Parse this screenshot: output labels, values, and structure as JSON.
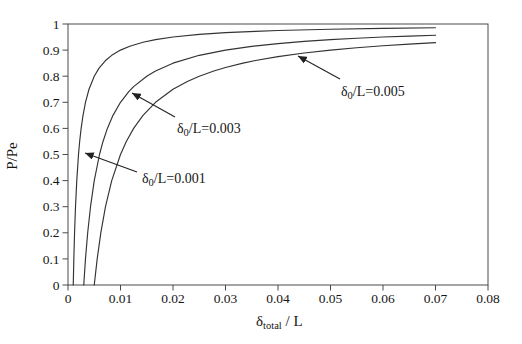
{
  "figure": {
    "background": "#ffffff"
  },
  "chart_data": {
    "type": "line",
    "title": "",
    "xlabel": {
      "symbol": "δ",
      "subscript": "total",
      "suffix": " / L"
    },
    "ylabel": "P/Pe",
    "xlim": [
      0,
      0.08
    ],
    "ylim": [
      0,
      1
    ],
    "grid": false,
    "frame": true,
    "legend_position": "none",
    "x_ticks": [
      {
        "v": 0,
        "label": "0"
      },
      {
        "v": 0.01,
        "label": "0.01"
      },
      {
        "v": 0.02,
        "label": "0.02"
      },
      {
        "v": 0.03,
        "label": "0.03"
      },
      {
        "v": 0.04,
        "label": "0.04"
      },
      {
        "v": 0.05,
        "label": "0.05"
      },
      {
        "v": 0.06,
        "label": "0.06"
      },
      {
        "v": 0.07,
        "label": "0.07"
      },
      {
        "v": 0.08,
        "label": "0.08"
      }
    ],
    "y_ticks": [
      {
        "v": 0,
        "label": "0"
      },
      {
        "v": 0.1,
        "label": "0.1"
      },
      {
        "v": 0.2,
        "label": "0.2"
      },
      {
        "v": 0.3,
        "label": "0.3"
      },
      {
        "v": 0.4,
        "label": "0.4"
      },
      {
        "v": 0.5,
        "label": "0.5"
      },
      {
        "v": 0.6,
        "label": "0.6"
      },
      {
        "v": 0.7,
        "label": "0.7"
      },
      {
        "v": 0.8,
        "label": "0.8"
      },
      {
        "v": 0.9,
        "label": "0.9"
      },
      {
        "v": 1,
        "label": "1"
      }
    ],
    "series": [
      {
        "id": "delta0-0001",
        "label_text": "δ0/L=0.001",
        "delta0_over_L": 0.001,
        "points": [
          [
            0.001,
            0
          ],
          [
            0.00111,
            0.1
          ],
          [
            0.00125,
            0.2
          ],
          [
            0.00143,
            0.3
          ],
          [
            0.00167,
            0.4
          ],
          [
            0.002,
            0.5
          ],
          [
            0.00222,
            0.55
          ],
          [
            0.0025,
            0.6
          ],
          [
            0.00286,
            0.65
          ],
          [
            0.00333,
            0.7
          ],
          [
            0.004,
            0.75
          ],
          [
            0.005,
            0.8
          ],
          [
            0.00588,
            0.83
          ],
          [
            0.00714,
            0.86
          ],
          [
            0.00833,
            0.88
          ],
          [
            0.01,
            0.9
          ],
          [
            0.01176,
            0.915
          ],
          [
            0.01429,
            0.93
          ],
          [
            0.01667,
            0.94
          ],
          [
            0.02,
            0.95
          ],
          [
            0.025,
            0.96
          ],
          [
            0.03,
            0.9667
          ],
          [
            0.03571,
            0.972
          ],
          [
            0.04,
            0.975
          ],
          [
            0.05,
            0.98
          ],
          [
            0.06,
            0.9833
          ],
          [
            0.07,
            0.9857
          ]
        ]
      },
      {
        "id": "delta0-0003",
        "label_text": "δ0/L=0.003",
        "delta0_over_L": 0.003,
        "points": [
          [
            0.003,
            0
          ],
          [
            0.00333,
            0.1
          ],
          [
            0.00375,
            0.2
          ],
          [
            0.00429,
            0.3
          ],
          [
            0.005,
            0.4
          ],
          [
            0.006,
            0.5
          ],
          [
            0.00667,
            0.55
          ],
          [
            0.0075,
            0.6
          ],
          [
            0.00857,
            0.65
          ],
          [
            0.01,
            0.7
          ],
          [
            0.01154,
            0.74
          ],
          [
            0.0125,
            0.76
          ],
          [
            0.015,
            0.8
          ],
          [
            0.01667,
            0.82
          ],
          [
            0.02,
            0.85
          ],
          [
            0.025,
            0.88
          ],
          [
            0.03,
            0.9
          ],
          [
            0.035,
            0.9143
          ],
          [
            0.04,
            0.925
          ],
          [
            0.045,
            0.9333
          ],
          [
            0.05,
            0.94
          ],
          [
            0.055,
            0.9455
          ],
          [
            0.06,
            0.95
          ],
          [
            0.065,
            0.9538
          ],
          [
            0.07,
            0.9571
          ]
        ]
      },
      {
        "id": "delta0-0005",
        "label_text": "δ0/L=0.005",
        "delta0_over_L": 0.005,
        "points": [
          [
            0.005,
            0
          ],
          [
            0.00556,
            0.1
          ],
          [
            0.00625,
            0.2
          ],
          [
            0.00714,
            0.3
          ],
          [
            0.00833,
            0.4
          ],
          [
            0.01,
            0.5
          ],
          [
            0.01111,
            0.55
          ],
          [
            0.0125,
            0.6
          ],
          [
            0.01429,
            0.65
          ],
          [
            0.01667,
            0.7
          ],
          [
            0.02,
            0.75
          ],
          [
            0.02273,
            0.78
          ],
          [
            0.025,
            0.8
          ],
          [
            0.02778,
            0.82
          ],
          [
            0.03,
            0.8333
          ],
          [
            0.03333,
            0.85
          ],
          [
            0.03571,
            0.86
          ],
          [
            0.04,
            0.875
          ],
          [
            0.045,
            0.8889
          ],
          [
            0.05,
            0.9
          ],
          [
            0.055,
            0.9091
          ],
          [
            0.06,
            0.9167
          ],
          [
            0.065,
            0.9231
          ],
          [
            0.07,
            0.9286
          ]
        ]
      }
    ],
    "annotations": [
      {
        "series": "delta0-0001",
        "text": {
          "symbol": "δ",
          "subscript": "0",
          "rest": "/L=0.001"
        },
        "text_px": [
          142,
          183
        ],
        "arrow_from_px": [
          137,
          172
        ],
        "arrow_to_px": [
          85,
          153
        ]
      },
      {
        "series": "delta0-0003",
        "text": {
          "symbol": "δ",
          "subscript": "0",
          "rest": "/L=0.003"
        },
        "text_px": [
          177,
          133
        ],
        "arrow_from_px": [
          175,
          117
        ],
        "arrow_to_px": [
          132,
          93
        ]
      },
      {
        "series": "delta0-0005",
        "text": {
          "symbol": "δ",
          "subscript": "0",
          "rest": "/L=0.005"
        },
        "text_px": [
          341,
          96
        ],
        "arrow_from_px": [
          340,
          79
        ],
        "arrow_to_px": [
          298,
          56
        ]
      }
    ],
    "layout": {
      "left": 68,
      "top": 24,
      "right": 488,
      "bottom": 285,
      "x_tick_label_y": 303,
      "y_tick_label_x": 59.5,
      "xlabel_pos": [
        256,
        326
      ],
      "ylabel_pos": [
        17,
        156
      ]
    },
    "colors": {
      "curve": "#333333",
      "frame": "#4a4a4a",
      "text": "#161616",
      "arrow": "#222222"
    }
  }
}
